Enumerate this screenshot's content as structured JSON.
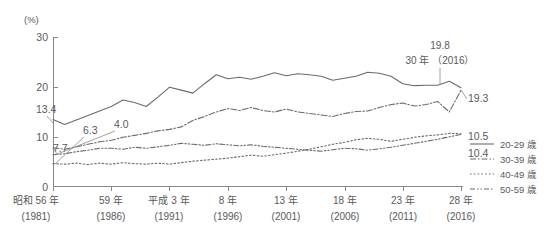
{
  "chart_data": {
    "type": "line",
    "title": "",
    "xlabel": "",
    "ylabel": "(%)",
    "ylim": [
      0,
      30
    ],
    "yticks": [
      0,
      10,
      20,
      30
    ],
    "grid": false,
    "legend_position": "right",
    "x": [
      1981,
      1982,
      1983,
      1984,
      1985,
      1986,
      1987,
      1988,
      1989,
      1990,
      1991,
      1992,
      1993,
      1994,
      1995,
      1996,
      1997,
      1998,
      1999,
      2000,
      2001,
      2002,
      2003,
      2004,
      2005,
      2006,
      2007,
      2008,
      2009,
      2010,
      2011,
      2012,
      2013,
      2014,
      2015,
      2016
    ],
    "xtick_labels": [
      {
        "era": "昭和 56 年",
        "year": "(1981)"
      },
      {
        "era": "59 年",
        "year": "(1986)"
      },
      {
        "era": "平成 3 年",
        "year": "(1991)"
      },
      {
        "era": "8 年",
        "year": "(1996)"
      },
      {
        "era": "13 年",
        "year": "(2001)"
      },
      {
        "era": "18 年",
        "year": "(2006)"
      },
      {
        "era": "23 年",
        "year": "(2011)"
      },
      {
        "era": "28 年",
        "year": "(2016)"
      }
    ],
    "xtick_values": [
      1981,
      1986,
      1991,
      1996,
      2001,
      2006,
      2011,
      2016
    ],
    "series": [
      {
        "name": "20-29 歳",
        "style": "solid",
        "start_label": "13.4",
        "end_label": "19.8",
        "values": [
          13.4,
          12.4,
          13.3,
          14.2,
          15.1,
          16.0,
          17.3,
          16.8,
          16.0,
          17.9,
          19.9,
          19.3,
          18.7,
          20.6,
          22.4,
          21.6,
          21.9,
          21.5,
          22.1,
          22.8,
          22.2,
          22.6,
          22.4,
          22.1,
          21.3,
          21.7,
          22.1,
          22.9,
          22.7,
          22.1,
          20.6,
          20.2,
          20.3,
          20.3,
          21.1,
          19.8
        ]
      },
      {
        "name": "30-39 歳",
        "style": "dash-dot",
        "start_label": "7.7",
        "end_label": "19.3",
        "values": [
          7.7,
          7.4,
          7.9,
          8.4,
          8.9,
          9.2,
          9.8,
          10.2,
          10.6,
          11.1,
          11.4,
          11.9,
          13.2,
          14.0,
          14.9,
          15.6,
          15.2,
          15.8,
          15.2,
          14.9,
          15.5,
          14.9,
          14.6,
          14.3,
          14.0,
          14.6,
          15.0,
          15.1,
          15.8,
          16.4,
          16.7,
          16.1,
          16.4,
          17.0,
          14.9,
          19.3
        ]
      },
      {
        "name": "40-49 歳",
        "style": "dotted",
        "start_label": "6.3",
        "end_label": "10.5",
        "values": [
          4.5,
          4.4,
          4.6,
          4.3,
          4.6,
          4.4,
          4.7,
          4.5,
          4.4,
          4.6,
          4.4,
          4.7,
          5.0,
          5.2,
          5.4,
          5.6,
          5.9,
          6.2,
          6.0,
          6.3,
          6.6,
          7.0,
          7.4,
          7.9,
          8.4,
          8.8,
          9.3,
          9.6,
          9.4,
          9.0,
          9.4,
          9.8,
          10.1,
          10.3,
          10.6,
          10.5
        ]
      },
      {
        "name": "50-59 歳",
        "style": "dash-dot-dot",
        "start_label": "4.0",
        "end_label": "10.4",
        "values": [
          6.3,
          6.5,
          6.9,
          7.2,
          7.6,
          7.6,
          7.4,
          7.8,
          7.6,
          7.9,
          8.2,
          8.6,
          8.4,
          8.2,
          8.5,
          8.3,
          8.1,
          8.3,
          8.0,
          7.8,
          7.6,
          7.4,
          7.2,
          7.0,
          7.3,
          7.6,
          7.5,
          7.2,
          7.5,
          7.8,
          8.2,
          8.6,
          9.0,
          9.4,
          9.9,
          10.4
        ]
      }
    ],
    "start_labels": [
      "13.4",
      "7.7",
      "6.3",
      "4.0"
    ],
    "end_labels": [
      "19.8",
      "19.3",
      "10.5",
      "10.4"
    ],
    "annotation": {
      "value": "19.8",
      "period": "30 年 （2016）"
    }
  }
}
